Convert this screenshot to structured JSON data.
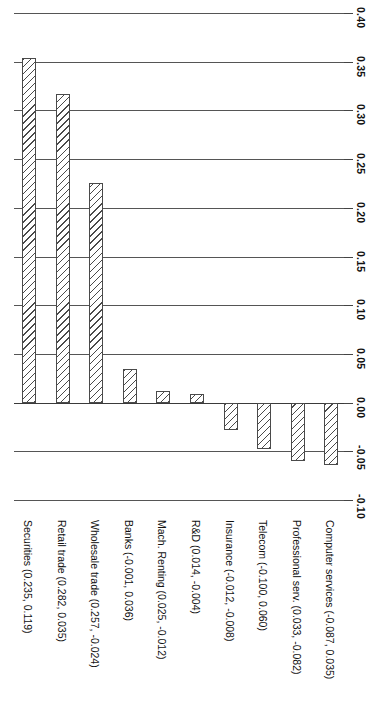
{
  "chart_data": {
    "type": "bar",
    "orientation": "vertical-rotated-90ccw",
    "title": "",
    "subtitle": "",
    "xlabel": "",
    "ylabel": "",
    "grid": true,
    "legend": null,
    "ylim": [
      -0.1,
      0.4
    ],
    "ytick_step": 0.05,
    "ytick_labels": [
      "0.40",
      "0.35",
      "0.30",
      "0.25",
      "0.20",
      "0.15",
      "0.10",
      "0.05",
      "0.00",
      "-0.05",
      "-0.10"
    ],
    "ytick_values": [
      0.4,
      0.35,
      0.3,
      0.25,
      0.2,
      0.15,
      0.1,
      0.05,
      0.0,
      -0.05,
      -0.1
    ],
    "categories": [
      "Securities (0.235, 0.119)",
      "Retail trade (0.282, 0.035)",
      "Wholesale trade (0.257, -0.024)",
      "Banks (-0.001, 0.036)",
      "Mach. Renting (0.025, -0.012)",
      "R&D (0.014, -0.004)",
      "Insurance (-0.012, -0.008)",
      "Telecom (-0.100, 0.060)",
      "Professional serv. (0.033, -0.082)",
      "Computer services (-0.087, 0.035)"
    ],
    "values": [
      0.354,
      0.317,
      0.225,
      0.035,
      0.012,
      0.009,
      -0.028,
      -0.048,
      -0.06,
      -0.064
    ],
    "bar_style": {
      "fill": "hatched-diagonal",
      "edge_color": "#4a4a4a",
      "face_color": "#ffffff"
    }
  },
  "axis": {
    "tick_count": 11,
    "zero_line_label": "0.00"
  }
}
